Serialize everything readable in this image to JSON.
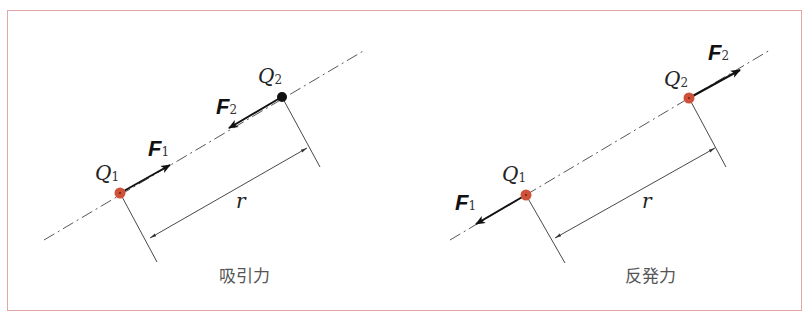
{
  "colors": {
    "frame_border": "#e3a6a6",
    "charge_red": "#d0513a",
    "charge_black": "#111111",
    "line": "#333333"
  },
  "panels": [
    {
      "id": "attraction",
      "caption": "吸引力",
      "charge1": {
        "label": "Q",
        "sub": "1",
        "color": "red"
      },
      "charge2": {
        "label": "Q",
        "sub": "2",
        "color": "black"
      },
      "force1": {
        "label": "F",
        "sub": "1",
        "direction": "toward Q2"
      },
      "force2": {
        "label": "F",
        "sub": "2",
        "direction": "toward Q1"
      },
      "distance_label": "r"
    },
    {
      "id": "repulsion",
      "caption": "反発力",
      "charge1": {
        "label": "Q",
        "sub": "1",
        "color": "red"
      },
      "charge2": {
        "label": "Q",
        "sub": "2",
        "color": "red"
      },
      "force1": {
        "label": "F",
        "sub": "1",
        "direction": "away from Q2"
      },
      "force2": {
        "label": "F",
        "sub": "2",
        "direction": "away from Q1"
      },
      "distance_label": "r"
    }
  ]
}
